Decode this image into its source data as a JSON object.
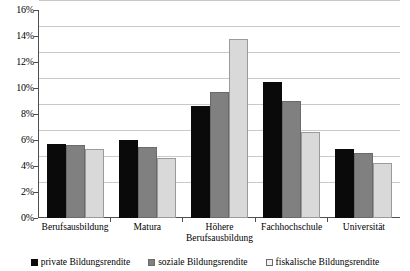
{
  "chart_data": {
    "type": "bar",
    "title": "",
    "subtitle": "",
    "xlabel": "",
    "ylabel": "",
    "ylim": [
      0,
      16
    ],
    "yticks": [
      "0%",
      "2%",
      "4%",
      "6%",
      "8%",
      "10%",
      "12%",
      "14%",
      "16%"
    ],
    "ytick_values": [
      0,
      2,
      4,
      6,
      8,
      10,
      12,
      14,
      16
    ],
    "grid": true,
    "legend_position": "bottom",
    "categories": [
      "Berufsausbildung",
      "Matura",
      "Höhere Berufsausbildung",
      "Fachhochschule",
      "Universität"
    ],
    "series": [
      {
        "name": "private Bildungsrendite",
        "color": "#0a0a0a",
        "values": [
          5.7,
          6.0,
          8.6,
          10.5,
          5.3
        ]
      },
      {
        "name": "soziale Bildungsrendite",
        "color": "#808080",
        "values": [
          5.6,
          5.5,
          9.7,
          9.0,
          5.0
        ]
      },
      {
        "name": "fiskalische Bildungsrendite",
        "color": "#d9d9d9",
        "values": [
          5.3,
          4.6,
          13.8,
          6.6,
          4.2
        ]
      }
    ]
  },
  "colors": {
    "axis": "#4d4d4d",
    "gridline": "#c9c9c9",
    "background": "#ffffff",
    "series_private": "#0a0a0a",
    "series_soziale": "#808080",
    "series_fiskalische": "#d9d9d9"
  }
}
